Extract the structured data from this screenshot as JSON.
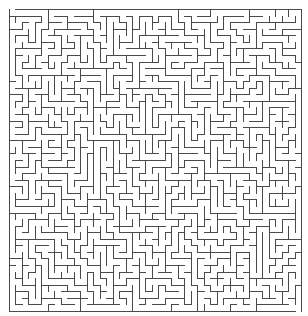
{
  "maze": {
    "cols": 45,
    "rows": 46,
    "origin_x": 8,
    "origin_y": 8,
    "width": 292,
    "height": 302,
    "wall_color": "#4a4a4a",
    "background_color": "#ffffff",
    "wall_width": 1,
    "seed": 20240611
  }
}
